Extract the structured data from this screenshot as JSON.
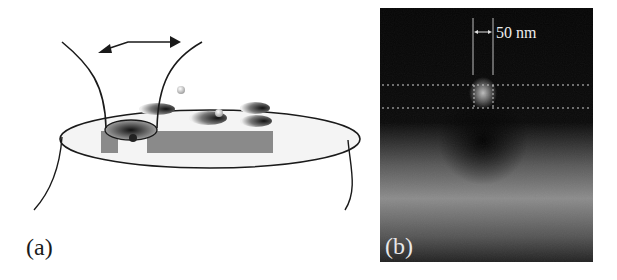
{
  "figure": {
    "panel_a": {
      "label": "(a)",
      "description": "Schematic of a tapered probe scanning over a sample disk with holes and particles"
    },
    "panel_b": {
      "label": "(b)",
      "scale_bar_text": "50 nm"
    }
  },
  "colors": {
    "line": "#1a1a1a",
    "rect_fill": "#8a8a8a",
    "panel_b_dark": "#050505",
    "panel_b_light": "#8c8c8c"
  }
}
